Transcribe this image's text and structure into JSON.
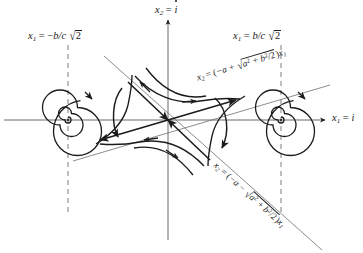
{
  "figure": {
    "background_color": "#ffffff",
    "ink_color": "#1c1c1c",
    "width": 363,
    "height": 253
  },
  "axes": {
    "horizontal": {
      "name": "x1-axis",
      "label_x1": "x",
      "label_sub": "1",
      "label_eq": " = ",
      "label_value": "i",
      "full_text": "x1 = i",
      "y_pixel": 120,
      "arrow": "right"
    },
    "vertical": {
      "name": "x2-axis",
      "label_x1": "x",
      "label_sub": "2",
      "label_eq": " = ",
      "label_value": "i",
      "full_text": "x2 = i-dot",
      "x_pixel": 168,
      "arrow": "up"
    }
  },
  "vertical_lines": [
    {
      "name": "left-equilibrium-line",
      "style": "dashed",
      "x_pixel": 68,
      "label_var": "x",
      "label_sub": "1",
      "label_eq": " = ",
      "label_sign": "−",
      "label_frac": "b/c ",
      "label_radicand": "2",
      "full_text": "x1 = -b/c sqrt(2)"
    },
    {
      "name": "right-equilibrium-line",
      "style": "dashed",
      "x_pixel": 281,
      "label_var": "x",
      "label_sub": "1",
      "label_eq": " = ",
      "label_sign": "",
      "label_frac": "b/c ",
      "label_radicand": "2",
      "full_text": "x1 = b/c sqrt(2)"
    }
  ],
  "separatrices": [
    {
      "name": "upper-eigenvector-line",
      "slope_sign": "positive",
      "label_var": "x",
      "label_sub": "2",
      "label_eq": " = (",
      "label_sign": "−a + ",
      "label_radicand_a": "a",
      "label_radicand_sup": "2",
      "label_radicand_b": " + b",
      "label_radicand_bsup": "2",
      "label_radicand_tail": "/2",
      "label_close": ")",
      "label_x1": "x",
      "label_x1_sub": "1",
      "full_text": "x2 = (-a + sqrt(a^2 + b^2/2))x1"
    },
    {
      "name": "lower-eigenvector-line",
      "slope_sign": "negative",
      "label_var": "x",
      "label_sub": "2",
      "label_eq": " = (",
      "label_sign": "−a − ",
      "label_radicand_a": "a",
      "label_radicand_sup": "2",
      "label_radicand_b": " + b",
      "label_radicand_bsup": "2",
      "label_radicand_tail": "/2",
      "label_close": ")",
      "label_x1": "x",
      "label_x1_sub": "1",
      "full_text": "x2 = (-a - sqrt(a^2 + b^2/2))x1"
    }
  ],
  "equilibria": [
    {
      "name": "left-spiral-focus",
      "type": "stable-spiral",
      "cx": 68,
      "cy": 120,
      "direction": "counterclockwise-inward"
    },
    {
      "name": "saddle-point",
      "type": "saddle",
      "cx": 168,
      "cy": 120
    },
    {
      "name": "right-spiral-focus",
      "type": "stable-spiral",
      "cx": 281,
      "cy": 120,
      "direction": "counterclockwise-inward"
    }
  ]
}
